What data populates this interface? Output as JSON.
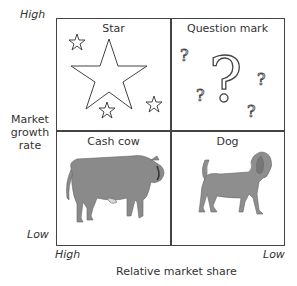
{
  "y_axis": {
    "label": "Market\ngrowth\nrate",
    "label_lines": [
      "Market",
      "growth",
      "rate"
    ],
    "high": "High",
    "low": "Low"
  },
  "x_axis": {
    "label": "Relative market share",
    "high": "High",
    "low": "Low"
  },
  "quadrants": [
    {
      "title": "Star",
      "icon": "star-icon",
      "position": "top-left"
    },
    {
      "title": "Question mark",
      "icon": "question-mark-icon",
      "position": "top-right"
    },
    {
      "title": "Cash cow",
      "icon": "cow-icon",
      "position": "bottom-left"
    },
    {
      "title": "Dog",
      "icon": "dog-icon",
      "position": "bottom-right"
    }
  ],
  "colors": {
    "line": "#444444",
    "animal": "#8a8a8a",
    "text": "#333333"
  }
}
